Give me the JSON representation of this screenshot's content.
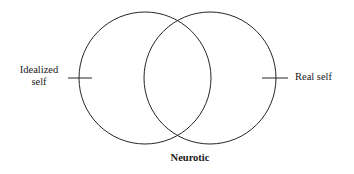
{
  "diagram": {
    "type": "venn",
    "title": "",
    "background_color": "#ffffff",
    "stroke_color": "#262626",
    "stroke_width": 1,
    "circles": [
      {
        "name": "idealized-self-circle",
        "cx": 145,
        "cy": 78,
        "r": 66,
        "fill": "none"
      },
      {
        "name": "real-self-circle",
        "cx": 210,
        "cy": 78,
        "r": 66,
        "fill": "none"
      }
    ],
    "ticks": [
      {
        "name": "left-tick",
        "x1": 68,
        "y1": 78,
        "x2": 92,
        "y2": 78
      },
      {
        "name": "right-tick",
        "x1": 262,
        "y1": 78,
        "x2": 288,
        "y2": 78
      }
    ],
    "labels": {
      "left": {
        "line1": "Idealized",
        "line2": "self",
        "weight": "normal"
      },
      "right": {
        "text": "Real self",
        "weight": "normal"
      },
      "bottom": {
        "text": "Neurotic",
        "weight": "bold"
      }
    }
  }
}
